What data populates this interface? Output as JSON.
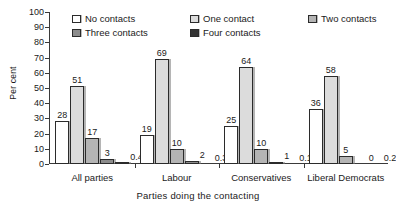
{
  "chart_data": {
    "type": "bar",
    "title": "",
    "subtitle": "",
    "xlabel": "Parties doing the contacting",
    "ylabel": "Per cent",
    "ylim": [
      0,
      100
    ],
    "yticks": [
      0,
      10,
      20,
      30,
      40,
      50,
      60,
      70,
      80,
      90,
      100
    ],
    "grid": false,
    "legend_position": "top-inside",
    "categories": [
      "All parties",
      "Labour",
      "Conservatives",
      "Liberal Democrats"
    ],
    "series": [
      {
        "name": "No contacts",
        "color": "#ffffff",
        "values": [
          28,
          19,
          25,
          36
        ],
        "labels": [
          "28",
          "19",
          "25",
          "36"
        ]
      },
      {
        "name": "One contact",
        "color": "#dcdcdc",
        "values": [
          51,
          69,
          64,
          58
        ],
        "labels": [
          "51",
          "69",
          "64",
          "58"
        ]
      },
      {
        "name": "Two contacts",
        "color": "#b4b4b4",
        "values": [
          17,
          10,
          10,
          5
        ],
        "labels": [
          "17",
          "10",
          "10",
          "5"
        ]
      },
      {
        "name": "Three contacts",
        "color": "#8c8c8c",
        "values": [
          3,
          2,
          1,
          0
        ],
        "labels": [
          "3",
          "2",
          "1",
          "0"
        ]
      },
      {
        "name": "Four contacts",
        "color": "#333333",
        "values": [
          0.4,
          0.3,
          0.1,
          0.2
        ],
        "labels": [
          "0.4",
          "0.3",
          "0.1",
          "0.2"
        ]
      }
    ]
  },
  "axis": {
    "y_title": "Per cent",
    "x_title": "Parties doing the contacting",
    "y_ticks": [
      "100",
      "90",
      "80",
      "70",
      "60",
      "50",
      "40",
      "30",
      "20",
      "10",
      "0"
    ],
    "x_labels": [
      "All parties",
      "Labour",
      "Conservatives",
      "Liberal Democrats"
    ]
  },
  "legend": {
    "items": [
      {
        "label": "No contacts",
        "swatch": "#ffffff"
      },
      {
        "label": "One contact",
        "swatch": "#dcdcdc"
      },
      {
        "label": "Two contacts",
        "swatch": "#b4b4b4"
      },
      {
        "label": "Three contacts",
        "swatch": "#8c8c8c"
      },
      {
        "label": "Four contacts",
        "swatch": "#333333"
      }
    ]
  }
}
